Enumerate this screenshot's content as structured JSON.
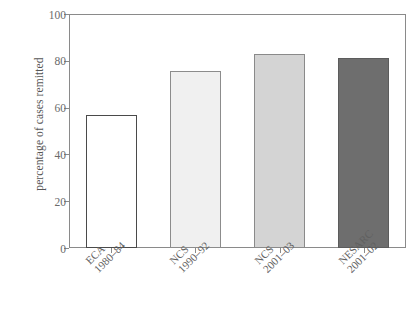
{
  "chart_data": {
    "type": "bar",
    "title": "",
    "xlabel": "",
    "ylabel": "percentage of cases remitted",
    "ylim": [
      0,
      100
    ],
    "yticks": [
      0,
      20,
      40,
      60,
      80,
      100
    ],
    "ytick_labels": [
      "0",
      "20",
      "40",
      "60",
      "80",
      "100"
    ],
    "grid": false,
    "legend": null,
    "categories": [
      "ECA 1980–84",
      "NCS 1990–92",
      "NCS 2001–03",
      "NESARC 2001–02"
    ],
    "values": [
      57,
      75.5,
      83,
      81
    ],
    "bars": [
      {
        "name": "ECA 1980–84",
        "line1": "ECA",
        "line2": "1980–84",
        "value": 57,
        "fill": "#ffffff",
        "stroke": "#4a4a4a"
      },
      {
        "name": "NCS 1990–92",
        "line1": "NCS",
        "line2": "1990–92",
        "value": 75.5,
        "fill": "#f0f0f0",
        "stroke": "#8c8c8c"
      },
      {
        "name": "NCS 2001–03",
        "line1": "NCS",
        "line2": "2001–03",
        "value": 83,
        "fill": "#d4d4d4",
        "stroke": "#8a8a8a"
      },
      {
        "name": "NESARC 2001–02",
        "line1": "NESARC",
        "line2": "2001–02",
        "value": 81,
        "fill": "#6e6e6e",
        "stroke": "#5c5c5c"
      }
    ],
    "axis_color": "#8a8a8a",
    "text_color": "#606060"
  }
}
